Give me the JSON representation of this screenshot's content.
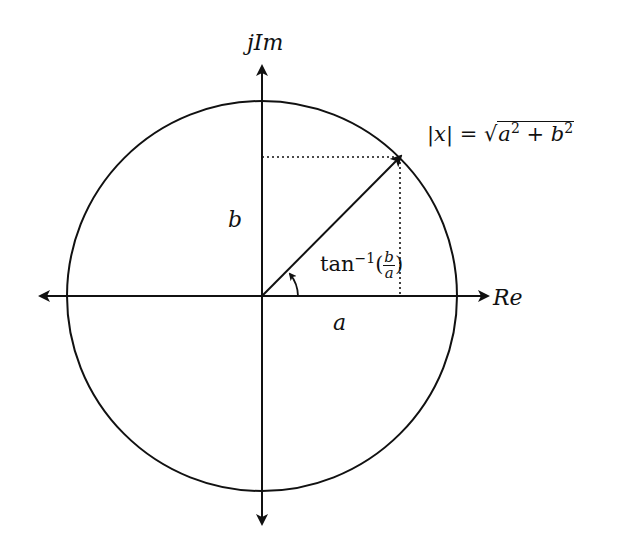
{
  "diagram": {
    "axes": {
      "vertical_label": "jIm",
      "horizontal_label": "Re"
    },
    "labels": {
      "b": "b",
      "a": "a",
      "magnitude_lhs": "|x| = ",
      "magnitude_sqrt": "√",
      "magnitude_a": "a",
      "magnitude_plus": " + ",
      "magnitude_b": "b",
      "exp2": "2",
      "angle_tan": "tan",
      "angle_exp": "−1",
      "angle_open": "(",
      "angle_num": "b",
      "angle_den": "a",
      "angle_close": ")"
    },
    "geometry": {
      "center": [
        262,
        296
      ],
      "radius": 195,
      "vector_tip": [
        400,
        157
      ]
    },
    "colors": {
      "stroke": "#111111",
      "background": "#ffffff"
    }
  }
}
